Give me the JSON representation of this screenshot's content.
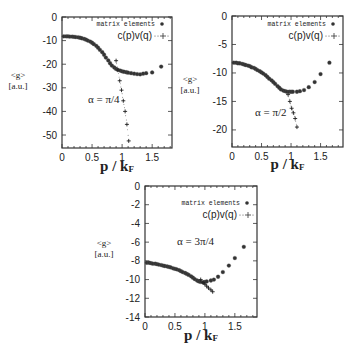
{
  "chart_data": [
    {
      "type": "scatter",
      "title": "",
      "annotation": "α = π/4",
      "xlabel": "p / kF",
      "ylabel": "<g> [a.u.]",
      "xlim": [
        0,
        1.83
      ],
      "ylim": [
        -55.5,
        0
      ],
      "xticks": [
        0,
        0.5,
        1,
        1.5
      ],
      "xtick_labels": [
        "0",
        "0.5",
        "1",
        "1.5"
      ],
      "yticks": [
        0,
        -10,
        -20,
        -30,
        -40,
        -50
      ],
      "ytick_labels": [
        "0",
        "-10",
        "-20",
        "-30",
        "-40",
        "-50"
      ],
      "legend": [
        "matrix elements",
        "c(p)v(q)"
      ],
      "legend_position": "upper right",
      "frame": {
        "left": 62,
        "right": 172,
        "top": 17,
        "bottom": 148
      },
      "series": [
        {
          "name": "matrix elements",
          "marker": "circle",
          "x": [
            0.03,
            0.07,
            0.1,
            0.13,
            0.17,
            0.2,
            0.23,
            0.27,
            0.3,
            0.33,
            0.37,
            0.4,
            0.43,
            0.47,
            0.5,
            0.53,
            0.57,
            0.6,
            0.63,
            0.67,
            0.7,
            0.73,
            0.77,
            0.8,
            0.83,
            0.87,
            0.9,
            0.93,
            0.97,
            1.0,
            1.03,
            1.07,
            1.1,
            1.15,
            1.2,
            1.25,
            1.3,
            1.35,
            1.4,
            1.5,
            1.65
          ],
          "y": [
            -8.2,
            -8.2,
            -8.2,
            -8.3,
            -8.3,
            -8.4,
            -8.5,
            -8.6,
            -8.8,
            -9.0,
            -9.3,
            -9.6,
            -10.0,
            -10.4,
            -10.9,
            -11.5,
            -12.2,
            -13.0,
            -13.9,
            -14.9,
            -16.0,
            -17.2,
            -18.4,
            -19.6,
            -20.6,
            -21.4,
            -22.0,
            -22.4,
            -22.7,
            -23.0,
            -23.2,
            -23.4,
            -23.6,
            -23.8,
            -24.0,
            -24.2,
            -24.3,
            -24.0,
            -23.8,
            -23.5,
            -21.0
          ]
        },
        {
          "name": "c(p)v(q)",
          "marker": "plus",
          "x": [
            0.9,
            0.93,
            0.96,
            0.99,
            1.02,
            1.05,
            1.08,
            1.11
          ],
          "y": [
            -18.5,
            -22.5,
            -27.0,
            -31.0,
            -35.5,
            -40.0,
            -45.5,
            -52.5
          ]
        }
      ]
    },
    {
      "type": "scatter",
      "title": "",
      "annotation": "α = π/2",
      "xlabel": "p / kF",
      "ylabel": "<g> [a.u.]",
      "xlim": [
        0,
        1.88
      ],
      "ylim": [
        -23,
        0
      ],
      "xticks": [
        0,
        0.5,
        1,
        1.5
      ],
      "xtick_labels": [
        "0",
        "0.5",
        "1",
        "1.5"
      ],
      "yticks": [
        0,
        -5,
        -10,
        -15,
        -20
      ],
      "ytick_labels": [
        "0",
        "-5",
        "-10",
        "-15",
        "-20"
      ],
      "legend": [
        "matrix elements",
        "c(p)v(q)"
      ],
      "legend_position": "upper right",
      "frame": {
        "left": 232,
        "right": 343,
        "top": 16,
        "bottom": 147
      },
      "series": [
        {
          "name": "matrix elements",
          "marker": "circle",
          "x": [
            0.03,
            0.07,
            0.1,
            0.13,
            0.17,
            0.2,
            0.23,
            0.27,
            0.3,
            0.33,
            0.37,
            0.4,
            0.43,
            0.47,
            0.5,
            0.53,
            0.57,
            0.6,
            0.63,
            0.67,
            0.7,
            0.73,
            0.77,
            0.8,
            0.83,
            0.87,
            0.9,
            0.93,
            0.97,
            1.0,
            1.03,
            1.1,
            1.15,
            1.22,
            1.3,
            1.4,
            1.5,
            1.65
          ],
          "y": [
            -8.2,
            -8.2,
            -8.3,
            -8.3,
            -8.4,
            -8.5,
            -8.6,
            -8.7,
            -8.8,
            -9.0,
            -9.1,
            -9.3,
            -9.5,
            -9.7,
            -9.9,
            -10.1,
            -10.4,
            -10.7,
            -11.0,
            -11.3,
            -11.6,
            -11.9,
            -12.3,
            -12.6,
            -12.9,
            -13.1,
            -13.2,
            -13.3,
            -13.3,
            -13.3,
            -13.3,
            -13.3,
            -13.2,
            -13.0,
            -12.5,
            -11.6,
            -10.2,
            -8.2
          ]
        },
        {
          "name": "c(p)v(q)",
          "marker": "plus",
          "x": [
            0.95,
            0.98,
            1.01,
            1.04,
            1.07,
            1.1
          ],
          "y": [
            -13.8,
            -15.0,
            -16.2,
            -17.0,
            -18.0,
            -19.5
          ]
        }
      ]
    },
    {
      "type": "scatter",
      "title": "",
      "annotation": "α = 3π/4",
      "xlabel": "p / kF",
      "ylabel": "<g> [a.u.]",
      "xlim": [
        0,
        1.87
      ],
      "ylim": [
        -14,
        0
      ],
      "xticks": [
        0,
        0.5,
        1,
        1.5
      ],
      "xtick_labels": [
        "0",
        "0.5",
        "1",
        "1.5"
      ],
      "yticks": [
        0,
        -2,
        -4,
        -6,
        -8,
        -10,
        -12,
        -14
      ],
      "ytick_labels": [
        "0",
        "-2",
        "-4",
        "-6",
        "-8",
        "-10",
        "-12",
        "-14"
      ],
      "legend": [
        "matrix elements",
        "c(p)v(q)"
      ],
      "legend_position": "upper right",
      "frame": {
        "left": 145,
        "right": 257,
        "top": 186,
        "bottom": 317
      },
      "series": [
        {
          "name": "matrix elements",
          "marker": "circle",
          "x": [
            0.03,
            0.07,
            0.1,
            0.13,
            0.17,
            0.2,
            0.23,
            0.27,
            0.3,
            0.33,
            0.37,
            0.4,
            0.43,
            0.47,
            0.5,
            0.53,
            0.57,
            0.6,
            0.63,
            0.67,
            0.7,
            0.73,
            0.77,
            0.8,
            0.83,
            0.87,
            0.9,
            0.93,
            0.97,
            1.0,
            1.03,
            1.1,
            1.15,
            1.22,
            1.3,
            1.4,
            1.5,
            1.65
          ],
          "y": [
            -8.2,
            -8.2,
            -8.25,
            -8.3,
            -8.3,
            -8.35,
            -8.4,
            -8.45,
            -8.5,
            -8.55,
            -8.6,
            -8.65,
            -8.7,
            -8.8,
            -8.85,
            -8.9,
            -9.0,
            -9.1,
            -9.2,
            -9.3,
            -9.4,
            -9.5,
            -9.65,
            -9.8,
            -9.95,
            -10.1,
            -10.2,
            -10.25,
            -10.3,
            -10.25,
            -10.2,
            -10.1,
            -10.0,
            -9.7,
            -9.2,
            -8.5,
            -7.7,
            -6.5
          ]
        },
        {
          "name": "c(p)v(q)",
          "marker": "plus",
          "x": [
            0.93,
            0.97,
            1.0,
            1.03,
            1.06,
            1.1,
            1.13
          ],
          "y": [
            -10.0,
            -10.3,
            -10.5,
            -10.7,
            -10.9,
            -11.1,
            -11.3
          ]
        }
      ]
    }
  ],
  "labels": {
    "ylabel_top": "<g>",
    "ylabel_bottom": "[a.u.]",
    "xlabel": "p / kF",
    "legend_matrix": "matrix elements",
    "legend_cpvq": "c(p)v(q)"
  }
}
